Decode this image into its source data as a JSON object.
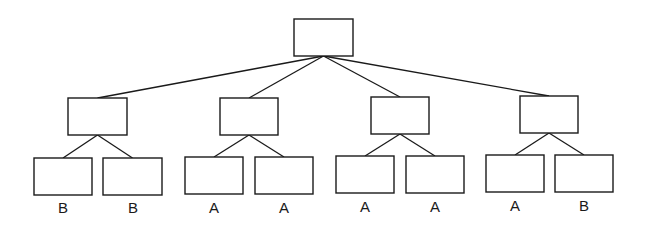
{
  "diagram": {
    "type": "tree",
    "root": {
      "id": "root",
      "x": 294,
      "y": 19,
      "w": 59,
      "h": 37
    },
    "internal": [
      {
        "id": "n1",
        "x": 68,
        "y": 98,
        "w": 59,
        "h": 37
      },
      {
        "id": "n2",
        "x": 220,
        "y": 98,
        "w": 58,
        "h": 37
      },
      {
        "id": "n3",
        "x": 371,
        "y": 97,
        "w": 58,
        "h": 37
      },
      {
        "id": "n4",
        "x": 520,
        "y": 96,
        "w": 58,
        "h": 37
      }
    ],
    "leaves": [
      {
        "id": "l1",
        "parent": "n1",
        "x": 34,
        "y": 158,
        "w": 58,
        "h": 37,
        "label": "B"
      },
      {
        "id": "l2",
        "parent": "n1",
        "x": 103,
        "y": 158,
        "w": 59,
        "h": 37,
        "label": "B"
      },
      {
        "id": "l3",
        "parent": "n2",
        "x": 185,
        "y": 157,
        "w": 58,
        "h": 37,
        "label": "A"
      },
      {
        "id": "l4",
        "parent": "n2",
        "x": 255,
        "y": 157,
        "w": 58,
        "h": 37,
        "label": "A"
      },
      {
        "id": "l5",
        "parent": "n3",
        "x": 336,
        "y": 156,
        "w": 58,
        "h": 37,
        "label": "A"
      },
      {
        "id": "l6",
        "parent": "n3",
        "x": 406,
        "y": 156,
        "w": 58,
        "h": 37,
        "label": "A"
      },
      {
        "id": "l7",
        "parent": "n4",
        "x": 486,
        "y": 155,
        "w": 58,
        "h": 37,
        "label": "A"
      },
      {
        "id": "l8",
        "parent": "n4",
        "x": 555,
        "y": 155,
        "w": 58,
        "h": 37,
        "label": "B"
      }
    ],
    "leaf_labels": [
      "B",
      "B",
      "A",
      "A",
      "A",
      "A",
      "A",
      "B"
    ],
    "colors": {
      "stroke": "#1a1a1a",
      "fill": "#ffffff",
      "background": "#ffffff"
    }
  }
}
